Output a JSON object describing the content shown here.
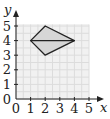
{
  "diagram": {
    "type": "coordinate-grid",
    "x_axis": {
      "label": "x",
      "ticks": [
        "0",
        "1",
        "2",
        "3",
        "4",
        "5"
      ],
      "min": 0,
      "max": 5
    },
    "y_axis": {
      "label": "y",
      "ticks": [
        "0",
        "1",
        "2",
        "3",
        "4",
        "5"
      ],
      "min": 0,
      "max": 5
    },
    "shape": {
      "name": "kite",
      "vertices": [
        [
          1,
          4
        ],
        [
          2,
          5
        ],
        [
          4,
          4
        ],
        [
          2,
          3
        ]
      ],
      "diagonal": [
        [
          1,
          4
        ],
        [
          4,
          4
        ]
      ],
      "fill": "#d6d6d6",
      "stroke": "#222222"
    },
    "colors": {
      "grid_background": "#f1f1f1",
      "grid_lines": "#dcdcdc",
      "axis": "#222222"
    }
  }
}
